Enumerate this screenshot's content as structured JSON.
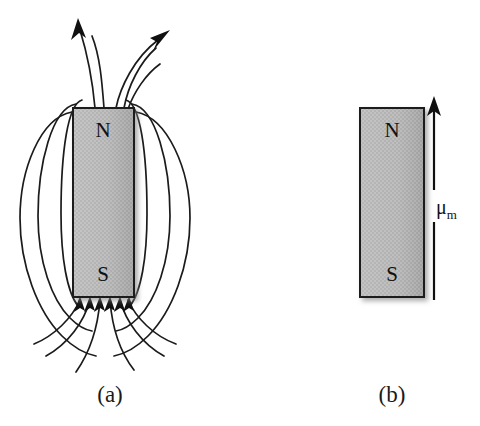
{
  "figure": {
    "type": "physics-diagram",
    "background_color": "#ffffff",
    "line_color": "#1b1b1b",
    "magnet_fill_color": "#b4b4b4",
    "magnet_border_color": "#1a1a1a"
  },
  "panels": [
    {
      "id": "a",
      "caption": "(a)",
      "caption_x": 110,
      "caption_y": 402,
      "magnet": {
        "x": 73,
        "y": 108,
        "width": 61,
        "height": 189,
        "north_label": "N",
        "north_label_x": 103,
        "north_label_y": 132,
        "south_label": "S",
        "south_label_x": 103,
        "south_label_y": 276
      },
      "field_arrow_count_top": 2,
      "field_arrow_count_bottom": 6,
      "closed_loop_count": 4
    },
    {
      "id": "b",
      "caption": "(b)",
      "caption_x": 392,
      "caption_y": 402,
      "magnet": {
        "x": 360,
        "y": 108,
        "width": 64,
        "height": 189,
        "north_label": "N",
        "north_label_x": 392,
        "north_label_y": 132,
        "south_label": "S",
        "south_label_x": 392,
        "south_label_y": 276
      },
      "moment_vector": {
        "symbol": "μ",
        "subscript": "m",
        "label_x": 440,
        "label_y": 211,
        "arrow_x": 434,
        "arrow_tip_y": 98,
        "arrow_tail_y": 300,
        "direction": "up"
      }
    }
  ]
}
